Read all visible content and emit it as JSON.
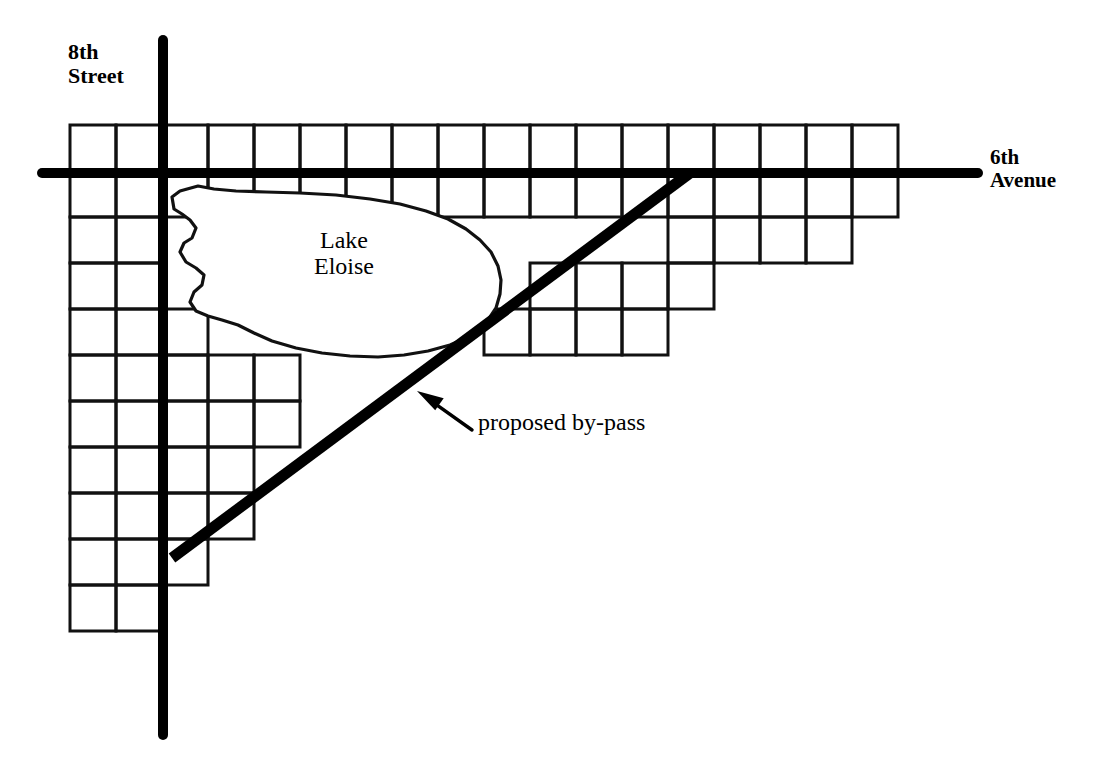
{
  "diagram": {
    "type": "schematic-map",
    "background_color": "#ffffff",
    "ink_color": "#000000"
  },
  "labels": {
    "street_8th": "8th\nStreet",
    "avenue_6th": "6th\nAvenue",
    "lake": "Lake\nEloise",
    "bypass": "proposed by-pass"
  },
  "icons": {
    "arrow": "arrow-up-left-icon"
  },
  "geometry": {
    "cell_size": 46,
    "grid_origin_x": 70,
    "grid_origin_y": 125,
    "grid_line_width": 3,
    "major_road_width": 10,
    "bypass_width": 11,
    "street_8th_line": {
      "x": 163,
      "y1": 40,
      "y2": 735
    },
    "avenue_6th_line": {
      "y": 173,
      "x1": 42,
      "x2": 978
    },
    "bypass_line": {
      "x1": 172,
      "y1": 558,
      "x2": 690,
      "y2": 173
    },
    "arrow": {
      "tip_x": 417,
      "tip_y": 391,
      "tail_x": 472,
      "tail_y": 430
    }
  },
  "chart_data": {
    "type": "table",
    "xlabel": "column index (46 px per block, origin x=70)",
    "ylabel": "row index (46 px per block, origin y=125)",
    "rows": [
      {
        "row": 0,
        "cols": [
          0,
          1,
          2,
          3,
          4,
          5,
          6,
          7,
          8,
          9,
          10,
          11,
          12,
          13,
          14,
          15,
          16,
          17
        ]
      },
      {
        "row": 1,
        "cols": [
          0,
          1,
          2,
          3,
          4,
          5,
          6,
          7,
          8,
          9,
          10,
          11,
          12,
          13,
          14,
          15,
          16,
          17
        ]
      },
      {
        "row": 2,
        "cols": [
          0,
          1,
          13,
          14,
          15,
          16
        ]
      },
      {
        "row": 3,
        "cols": [
          0,
          1,
          10,
          11,
          12,
          13
        ]
      },
      {
        "row": 4,
        "cols": [
          0,
          1,
          2,
          9,
          10,
          11,
          12
        ]
      },
      {
        "row": 5,
        "cols": [
          0,
          1,
          2,
          3,
          4
        ]
      },
      {
        "row": 6,
        "cols": [
          0,
          1,
          2,
          3,
          4
        ]
      },
      {
        "row": 7,
        "cols": [
          0,
          1,
          2,
          3
        ]
      },
      {
        "row": 8,
        "cols": [
          0,
          1,
          2,
          3
        ]
      },
      {
        "row": 9,
        "cols": [
          0,
          1,
          2
        ]
      },
      {
        "row": 10,
        "cols": [
          0,
          1
        ]
      }
    ]
  },
  "lake_outline": "M 180,191 L 172,197 L 174,209 L 182,214 L 190,220 L 196,228 L 192,238 L 184,243 L 180,252 L 186,262 L 196,268 L 204,275 L 202,285 L 194,292 L 190,302 L 196,311 L 208,316 L 222,320 L 238,325 L 254,333 L 272,341 L 296,348 L 322,353 L 350,356 L 378,357 L 404,355 L 428,351 L 450,345 L 466,338 L 478,330 L 488,320 L 496,308 L 500,294 L 501,280 L 498,266 L 491,252 L 480,240 L 466,229 L 448,219 L 426,211 L 400,204 L 370,199 L 336,195 L 300,193 L 266,192 L 236,191 L 214,189 L 198,186 Z"
}
